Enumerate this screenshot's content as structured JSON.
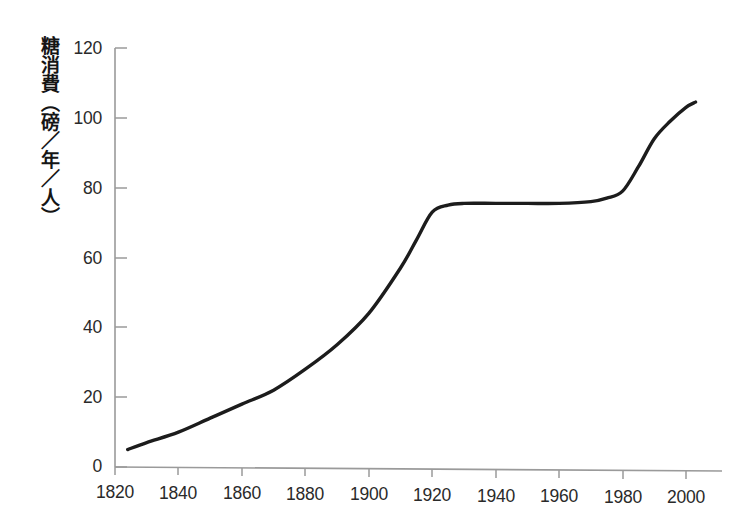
{
  "chart_data": {
    "type": "line",
    "title": "",
    "xlabel": "",
    "ylabel": "糖消費（磅／年／人）",
    "xlim": [
      1820,
      2010
    ],
    "ylim": [
      0,
      120
    ],
    "grid": false,
    "legend": "none",
    "x_ticks": [
      "1820",
      "1840",
      "1860",
      "1880",
      "1900",
      "1920",
      "1940",
      "1960",
      "1980",
      "2000"
    ],
    "y_ticks": [
      "0",
      "20",
      "40",
      "60",
      "80",
      "100",
      "120"
    ],
    "series": [
      {
        "name": "糖消費",
        "color": "#1c1c1c",
        "x": [
          1824,
          1830,
          1840,
          1850,
          1860,
          1870,
          1880,
          1890,
          1900,
          1910,
          1915,
          1920,
          1925,
          1930,
          1940,
          1950,
          1960,
          1970,
          1975,
          1980,
          1985,
          1990,
          1995,
          2000,
          2003
        ],
        "y": [
          5,
          7,
          10,
          14,
          18,
          22,
          28,
          35,
          44,
          57,
          65,
          73,
          75,
          75.5,
          75.5,
          75.5,
          75.5,
          76,
          77,
          79,
          86,
          94,
          99,
          103,
          104.5
        ]
      }
    ]
  },
  "axes": {
    "y_axis_name": "y-axis-line",
    "x_axis_name": "x-axis-line",
    "axis_color": "#999999",
    "curve_color": "#1c1c1c"
  }
}
